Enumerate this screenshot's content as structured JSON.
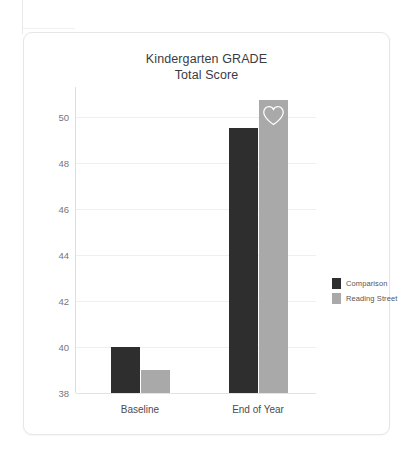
{
  "card": {
    "title_line1": "Kindergarten GRADE",
    "title_line2": "Total Score",
    "title": "Kindergarten GRADE\nTotal Score"
  },
  "legend": {
    "position": "right",
    "items": [
      {
        "label": "Comparison",
        "color": "#2e2e2e"
      },
      {
        "label": "Reading Street",
        "color": "#a9a9a9"
      }
    ]
  },
  "annotations": {
    "heart_icon": "heart-icon",
    "heart_on_series": "Reading Street",
    "heart_on_category": "End of Year",
    "heart_color": "#ffffff"
  },
  "chart_data": {
    "type": "bar",
    "title": "Kindergarten GRADE Total Score",
    "xlabel": "",
    "ylabel": "",
    "categories": [
      "Baseline",
      "End of Year"
    ],
    "series": [
      {
        "name": "Comparison",
        "color": "#2e2e2e",
        "values": [
          40.0,
          49.5
        ]
      },
      {
        "name": "Reading Street",
        "color": "#a9a9a9",
        "values": [
          39.0,
          50.75
        ]
      }
    ],
    "ylim": [
      38,
      51.3
    ],
    "yticks": [
      38,
      40,
      42,
      44,
      46,
      48,
      50
    ],
    "ytick_labels": [
      "38",
      "40",
      "42",
      "44",
      "46",
      "48",
      "50"
    ],
    "grid": true,
    "grid_axis": "y",
    "legend_position": "right",
    "annotations": [
      {
        "type": "heart",
        "category": "End of Year",
        "series": "Reading Street"
      }
    ]
  }
}
